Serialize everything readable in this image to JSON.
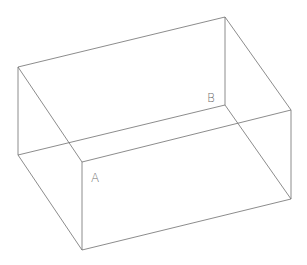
{
  "diagram": {
    "type": "wireframe-box",
    "stroke_color": "#6e6e6e",
    "background": "#ffffff",
    "vertices": {
      "top_left": [
        18,
        67
      ],
      "top_back": [
        225,
        17
      ],
      "top_right": [
        291,
        110
      ],
      "top_front": [
        82,
        162
      ],
      "bottom_left": [
        18,
        155
      ],
      "bottom_back": [
        225,
        105
      ],
      "bottom_right": [
        291,
        199
      ],
      "bottom_front": [
        82,
        250
      ]
    },
    "labels": [
      {
        "id": "A",
        "text": "A",
        "x": 91,
        "y": 182
      },
      {
        "id": "B",
        "text": "B",
        "x": 207,
        "y": 102
      }
    ]
  }
}
